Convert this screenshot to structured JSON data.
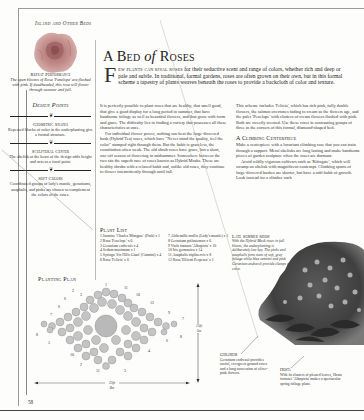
{
  "running_head": "Island and Other Beds",
  "page_number": "58",
  "title": {
    "part1": "A Bed",
    "part2": "of",
    "part3": "Roses"
  },
  "intro": {
    "dropcap": "F",
    "lead": "ew plants can rival roses",
    "text": " for their seductive scent and range of colors, whether rich and deep or pale and subtle. In traditional, formal gardens, roses are often grown on their own, but in this formal scheme a tapestry of plants weaves beneath the roses to provide a backcloth of color and texture."
  },
  "sidebar": {
    "repeat_performance": {
      "title": "Repeat Performance",
      "text": "The open blooms of Rosa 'Penelope' are flushed with pink. If deadheaded, this rose will flower through summer and fall."
    },
    "design_points_heading": "Design Points",
    "ornament": "❦",
    "points": [
      {
        "title": "Geometric Shapes",
        "text": "Repeated blocks of color in the underplanting give a formal structure."
      },
      {
        "title": "Sculptural Center",
        "text": "The obelisk at the heart of the design adds height and acts as a focal point."
      },
      {
        "title": "Soft Colors",
        "text": "Coordinated groups of lady's mantle, geraniums, anaphalis, and pinks are chosen to complement the colors of the roses."
      }
    ]
  },
  "column1": {
    "paragraphs": [
      "It is perfectly possible to plant roses that are healthy, that smell good, that give a good display for a long period in summer, that have handsome foliage as well as beautiful flowers, and that grow with form and grace. The difficulty lies in finding a variety that possesses all these characteristics at once.",
      "For individual flower power, nothing can beat the large-flowered bush (Hybrid Tea) roses, which have \"Never mind the quality, feel the color\" stamped right through them. But the habit is graceless, the constitution often weak. The old shrub roses have grace, but a short, one-off season of flowering in midsummer. Somewhere between the two sits the superb race of roses known as Hybrid Musks. These are healthy shrubs with a relaxed habit and, unlike old roses, they continue to flower intermittently through until fall."
    ]
  },
  "column2": {
    "paragraphs": [
      "This scheme includes 'Felicia', which has rich pink, fully double flowers, the salmon overtones fading to cream as the flowers age, and the paler 'Penelope' with clusters of cream flowers flushed with pink. Both are sweetly scented. Use these roses in contrasting groups of three in the corners of this formal, diamond-shaped bed."
    ],
    "climbing": {
      "heading": "A Climbing Centerpiece",
      "paragraphs": [
        "Make a centerpiece with a luxuriant climbing rose that you can train through a support. Metal obelisks are long lasting and make handsome pieces of garden sculpture when the roses are dormant.",
        "Avoid wildly vigorous cultivars such as 'Kiftsgate', which will swamp an obelisk with magnificent contempt. Climbing sports of large-flowered bushes are shorter, but have a stiff habit of growth. Look instead for a climber such"
      ]
    }
  },
  "plant_list": {
    "title": "Plant List",
    "left": [
      "1 Jasmine 'Charles Mongase' (Pink) x 1",
      "2 Rosa 'Penelope' x 6",
      "3 Geranium endressii x 4",
      "4 Sedum maximum x 1",
      "5 Syringa 'Six Hills Giant' (Catmint) x 4",
      "6 Rosa 'Felicia' x 6"
    ],
    "right": [
      "7 Alchemilla mollis (Lady's mantle) x 1",
      "8 Geranium psilostemon x 6",
      "9 Viola fontana 'Albopicta' x 10",
      "10 Iris germanica x 14",
      "11 Anaphalis triplinervis x 8",
      "12 Rosa 'Ellicott Perpetua' x 1"
    ]
  },
  "planting_plan": {
    "title": "Planting Plan",
    "width_label_ft": "25ft",
    "width_label_m": "8m",
    "height_label_ft": "15ft",
    "height_label_m": "5m",
    "labels": [
      "1",
      "2",
      "3",
      "4",
      "5",
      "6",
      "7",
      "8",
      "9",
      "10",
      "11",
      "12"
    ]
  },
  "late_summer": {
    "title": "Late Summer Show",
    "text": "With the Hybrid Musk roses in full bloom, the underplanting is deliberately low key. The pinks and anaphalis form mats of soft, gray foliage while blue catmint and pink Geranium endressii provide clumps of color."
  },
  "captions": {
    "geranium": {
      "title": "Geranium",
      "text": "Geranium endressii provides useful, evergreen ground cover and a long succession of silver-pink flowers."
    },
    "hosta": {
      "title": "Hosta",
      "text": "With its clusters of pleated leaves, Hosta fortunei 'Albopicta' makes a spectacular spring foliage plant."
    }
  },
  "colors": {
    "text": "#2b2b2b",
    "rose_pink": "#c98b8b",
    "foliage_dark": "#3a3a3a",
    "plan_circle": "#b5b5b5"
  }
}
